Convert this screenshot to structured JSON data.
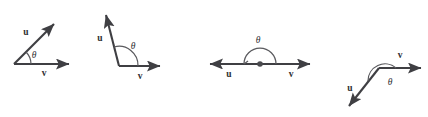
{
  "figure": {
    "width": 428,
    "height": 117,
    "background_color": "#ffffff",
    "stroke_color": "#3f3f43",
    "arc_color": "#5a5a5e",
    "label_color": "#2f2f33"
  },
  "labels": {
    "u": "u",
    "v": "v",
    "theta": "θ"
  },
  "diagrams": [
    {
      "id": "acute-angle",
      "name": "Acute angle between u and v",
      "angle_degrees": 35,
      "vertex": {
        "x": 14,
        "y": 64
      },
      "u_tip": {
        "x": 57,
        "y": 21
      },
      "v_tip": {
        "x": 73,
        "y": 64
      },
      "u_label_pos": {
        "x": 26,
        "y": 35
      },
      "v_label_pos": {
        "x": 44,
        "y": 76
      },
      "theta_label_pos": {
        "x": 34,
        "y": 57
      },
      "arc_radius": 17,
      "labels": {
        "u": "u",
        "v": "v",
        "theta": "θ"
      }
    },
    {
      "id": "obtuse-angle",
      "name": "Obtuse angle between u and v",
      "angle_degrees": 105,
      "vertex": {
        "x": 119,
        "y": 66
      },
      "u_tip": {
        "x": 104,
        "y": 10
      },
      "v_tip": {
        "x": 164,
        "y": 66
      },
      "u_label_pos": {
        "x": 100,
        "y": 38
      },
      "v_label_pos": {
        "x": 140,
        "y": 79
      },
      "theta_label_pos": {
        "x": 133,
        "y": 48
      },
      "arc_radius": 19,
      "labels": {
        "u": "u",
        "v": "v",
        "theta": "θ"
      }
    },
    {
      "id": "straight-angle",
      "name": "Straight (180 degree) angle between u and v",
      "angle_degrees": 180,
      "vertex": {
        "x": 260,
        "y": 64
      },
      "u_tip": {
        "x": 206,
        "y": 64
      },
      "v_tip": {
        "x": 314,
        "y": 64
      },
      "u_label_pos": {
        "x": 229,
        "y": 77
      },
      "v_label_pos": {
        "x": 291,
        "y": 77
      },
      "theta_label_pos": {
        "x": 258,
        "y": 42
      },
      "arc_radius": 16,
      "labels": {
        "u": "u",
        "v": "v",
        "theta": "θ"
      }
    },
    {
      "id": "reflex-obtuse-angle",
      "name": "Obtuse angle between u and v with downward u",
      "angle_degrees": 133,
      "vertex": {
        "x": 379,
        "y": 68
      },
      "u_tip": {
        "x": 345,
        "y": 110
      },
      "v_tip": {
        "x": 425,
        "y": 68
      },
      "u_label_pos": {
        "x": 350,
        "y": 89
      },
      "v_label_pos": {
        "x": 400,
        "y": 58
      },
      "theta_label_pos": {
        "x": 390,
        "y": 84
      },
      "arc_radius": 17,
      "labels": {
        "u": "u",
        "v": "v",
        "theta": "θ"
      }
    }
  ]
}
